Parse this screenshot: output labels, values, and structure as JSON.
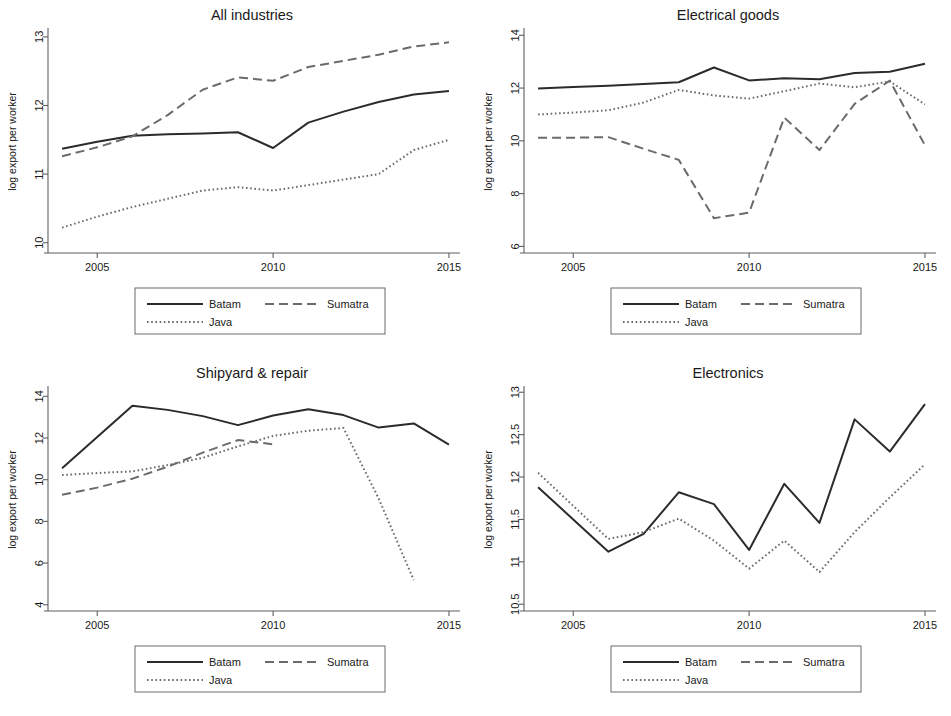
{
  "figure": {
    "background": "#ffffff",
    "series_colors": {
      "Batam": "#2b2b2b",
      "Sumatra": "#6b6b6b",
      "Java": "#6b6b6b"
    },
    "axis_color": "#5f5f5f",
    "ylabel": "log export per worker",
    "legend": {
      "entries": [
        {
          "label": "Batam",
          "style": "solid"
        },
        {
          "label": "Sumatra",
          "style": "dashed"
        },
        {
          "label": "Java",
          "style": "dotted"
        }
      ]
    }
  },
  "chart_data": [
    {
      "type": "line",
      "title": "All industries",
      "xlabel": "",
      "ylabel": "log export per worker",
      "xlim": [
        2003.6,
        2015.2
      ],
      "ylim": [
        9.85,
        13.1
      ],
      "xticks": [
        2005,
        2010,
        2015
      ],
      "yticks": [
        10,
        11,
        12,
        13
      ],
      "xtick_labels": [
        "2005",
        "2010",
        "2015"
      ],
      "ytick_labels": [
        "10",
        "11",
        "12",
        "13"
      ],
      "grid": false,
      "legend_position": "below-center",
      "x": [
        2004,
        2005,
        2006,
        2007,
        2008,
        2009,
        2010,
        2011,
        2012,
        2013,
        2014,
        2015
      ],
      "series": [
        {
          "name": "Batam",
          "style": "solid",
          "values": [
            11.37,
            11.47,
            11.56,
            11.58,
            11.59,
            11.61,
            11.38,
            11.75,
            11.91,
            12.05,
            12.16,
            12.21
          ]
        },
        {
          "name": "Sumatra",
          "style": "dashed",
          "values": [
            11.26,
            11.39,
            11.55,
            11.86,
            12.23,
            12.41,
            12.36,
            12.56,
            12.65,
            12.74,
            12.86,
            12.92
          ]
        },
        {
          "name": "Java",
          "style": "dotted",
          "values": [
            10.22,
            10.38,
            10.52,
            10.64,
            10.76,
            10.81,
            10.76,
            10.84,
            10.92,
            11.0,
            11.35,
            11.5
          ]
        }
      ]
    },
    {
      "type": "line",
      "title": "Electrical goods",
      "xlabel": "",
      "ylabel": "log export per worker",
      "xlim": [
        2003.6,
        2015.2
      ],
      "ylim": [
        5.75,
        14.2
      ],
      "xticks": [
        2005,
        2010,
        2015
      ],
      "yticks": [
        6,
        8,
        10,
        12,
        14
      ],
      "xtick_labels": [
        "2005",
        "2010",
        "2015"
      ],
      "ytick_labels": [
        "6",
        "8",
        "10",
        "12",
        "14"
      ],
      "grid": false,
      "legend_position": "below-center",
      "x": [
        2004,
        2005,
        2006,
        2007,
        2008,
        2009,
        2010,
        2011,
        2012,
        2013,
        2014,
        2015
      ],
      "series": [
        {
          "name": "Batam",
          "style": "solid",
          "values": [
            11.98,
            12.04,
            12.09,
            12.15,
            12.22,
            12.78,
            12.29,
            12.37,
            12.33,
            12.57,
            12.62,
            12.92
          ]
        },
        {
          "name": "Sumatra",
          "style": "dashed",
          "values": [
            10.12,
            10.12,
            10.14,
            9.7,
            9.28,
            7.07,
            7.28,
            10.88,
            9.65,
            11.4,
            12.28,
            9.83
          ]
        },
        {
          "name": "Java",
          "style": "dotted",
          "values": [
            11.0,
            11.07,
            11.16,
            11.45,
            11.93,
            11.72,
            11.6,
            11.88,
            12.17,
            12.03,
            12.25,
            11.38
          ]
        }
      ]
    },
    {
      "type": "line",
      "title": "Shipyard & repair",
      "xlabel": "",
      "ylabel": "log export per worker",
      "xlim": [
        2003.6,
        2015.2
      ],
      "ylim": [
        3.7,
        14.4
      ],
      "xticks": [
        2005,
        2010,
        2015
      ],
      "yticks": [
        4,
        6,
        8,
        10,
        12,
        14
      ],
      "xtick_labels": [
        "2005",
        "2010",
        "2015"
      ],
      "ytick_labels": [
        "4",
        "6",
        "8",
        "10",
        "12",
        "14"
      ],
      "grid": false,
      "legend_position": "below-center",
      "x": [
        2004,
        2005,
        2006,
        2007,
        2008,
        2009,
        2010,
        2011,
        2012,
        2013,
        2014,
        2015
      ],
      "series": [
        {
          "name": "Batam",
          "style": "solid",
          "values": [
            10.55,
            12.05,
            13.55,
            13.35,
            13.05,
            12.62,
            13.08,
            13.38,
            13.1,
            12.5,
            12.7,
            11.68
          ]
        },
        {
          "name": "Sumatra",
          "style": "dashed",
          "values": [
            9.28,
            9.62,
            10.05,
            10.62,
            11.3,
            11.9,
            11.7,
            null,
            null,
            null,
            null,
            null
          ]
        },
        {
          "name": "Java",
          "style": "dotted",
          "values": [
            10.22,
            10.32,
            10.4,
            10.7,
            11.05,
            11.6,
            12.1,
            12.35,
            12.48,
            9.1,
            5.18,
            null
          ]
        }
      ]
    },
    {
      "type": "line",
      "title": "Electronics",
      "xlabel": "",
      "ylabel": "log export per worker",
      "xlim": [
        2003.6,
        2015.2
      ],
      "ylim": [
        10.42,
        13.05
      ],
      "xticks": [
        2005,
        2010,
        2015
      ],
      "yticks": [
        10.5,
        11,
        11.5,
        12,
        12.5,
        13
      ],
      "xtick_labels": [
        "2005",
        "2010",
        "2015"
      ],
      "ytick_labels": [
        "10.5",
        "11",
        "11.5",
        "12",
        "12.5",
        "13"
      ],
      "grid": false,
      "legend_position": "below-center",
      "x": [
        2004,
        2005,
        2006,
        2007,
        2008,
        2009,
        2010,
        2011,
        2012,
        2013,
        2014,
        2015
      ],
      "series": [
        {
          "name": "Batam",
          "style": "solid",
          "values": [
            11.88,
            11.5,
            11.12,
            11.33,
            11.82,
            11.68,
            11.14,
            11.92,
            11.46,
            12.68,
            12.3,
            12.86
          ]
        },
        {
          "name": "Java",
          "style": "dotted",
          "values": [
            12.05,
            11.66,
            11.27,
            11.35,
            11.51,
            11.25,
            10.92,
            11.25,
            10.88,
            11.35,
            11.76,
            12.15
          ]
        }
      ]
    }
  ]
}
